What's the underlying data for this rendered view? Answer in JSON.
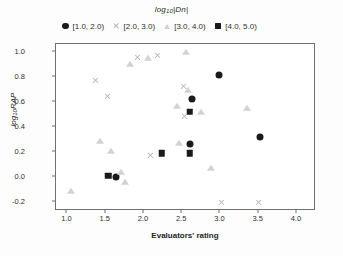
{
  "chart_data": {
    "type": "scatter",
    "title": "log10|Dn|",
    "title_base": "log",
    "title_sub": "10",
    "title_tail": "|Dn|",
    "xlabel": "Evaluators' rating",
    "ylabel": "log10RAP",
    "ylabel_base": "log",
    "ylabel_sub": "10",
    "ylabel_tail": "RAP",
    "xlim": [
      0.85,
      4.25
    ],
    "ylim": [
      -0.27,
      1.06
    ],
    "xticks": [
      1.0,
      1.5,
      2.0,
      2.5,
      3.0,
      3.5,
      4.0
    ],
    "xtick_labels": [
      "1.0",
      "1.5",
      "2.0",
      "2.5",
      "3.0",
      "3.5",
      "4.0"
    ],
    "yticks": [
      -0.2,
      0.0,
      0.2,
      0.4,
      0.6,
      0.8,
      1.0
    ],
    "ytick_labels": [
      "-0.2",
      "0.0",
      "0.2",
      "0.4",
      "0.6",
      "0.8",
      "1.0"
    ],
    "grid": false,
    "legend_position": "top",
    "series": [
      {
        "name": "[1.0, 2.0)",
        "marker": "circle",
        "color": "#1a1a1a",
        "size": 7,
        "points": [
          {
            "x": 1.63,
            "y": 0.0
          },
          {
            "x": 2.63,
            "y": 0.62
          },
          {
            "x": 2.6,
            "y": 0.26
          },
          {
            "x": 2.98,
            "y": 0.81
          },
          {
            "x": 3.52,
            "y": 0.32
          }
        ]
      },
      {
        "name": "[2.0, 3.0)",
        "marker": "cross",
        "color": "#b5b5b5",
        "size": 7,
        "points": [
          {
            "x": 1.52,
            "y": 0.64
          },
          {
            "x": 1.37,
            "y": 0.77
          },
          {
            "x": 1.92,
            "y": 0.95
          },
          {
            "x": 2.18,
            "y": 0.97
          },
          {
            "x": 2.52,
            "y": 0.72
          },
          {
            "x": 2.53,
            "y": 0.48
          },
          {
            "x": 2.08,
            "y": 0.17
          },
          {
            "x": 3.02,
            "y": -0.2
          },
          {
            "x": 3.5,
            "y": -0.2
          }
        ]
      },
      {
        "name": "[3.0, 4.0)",
        "marker": "triangle",
        "color": "#d2d2d2",
        "size": 7,
        "points": [
          {
            "x": 1.05,
            "y": -0.11
          },
          {
            "x": 1.42,
            "y": 0.29
          },
          {
            "x": 1.7,
            "y": 0.04
          },
          {
            "x": 1.75,
            "y": -0.04
          },
          {
            "x": 1.57,
            "y": 0.21
          },
          {
            "x": 1.82,
            "y": 0.9
          },
          {
            "x": 2.05,
            "y": 0.95
          },
          {
            "x": 2.43,
            "y": 0.57
          },
          {
            "x": 2.46,
            "y": 0.27
          },
          {
            "x": 2.55,
            "y": 1.0
          },
          {
            "x": 2.57,
            "y": 0.69
          },
          {
            "x": 2.75,
            "y": 0.52
          },
          {
            "x": 3.35,
            "y": 0.55
          },
          {
            "x": 2.88,
            "y": 0.07
          }
        ]
      },
      {
        "name": "[4.0, 5.0)",
        "marker": "square",
        "color": "#1a1a1a",
        "size": 6.5,
        "points": [
          {
            "x": 1.53,
            "y": 0.01
          },
          {
            "x": 2.23,
            "y": 0.19
          },
          {
            "x": 2.6,
            "y": 0.19
          },
          {
            "x": 2.6,
            "y": 0.52
          }
        ]
      }
    ]
  }
}
